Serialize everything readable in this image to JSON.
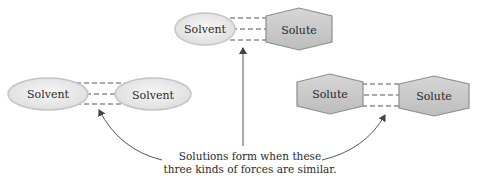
{
  "diagram": {
    "colors": {
      "solvent_fill": "#ececec",
      "solvent_stroke": "#c4c4c4",
      "solute_fill": "#c9c9c9",
      "solute_stroke": "#8e8e8e",
      "dash": "#555555",
      "arrow": "#555555",
      "text": "#2a2a2a"
    },
    "pairs": [
      {
        "id": "solvent-solute",
        "left": {
          "shape": "ellipse",
          "label": "Solvent"
        },
        "right": {
          "shape": "hexagon",
          "label": "Solute"
        }
      },
      {
        "id": "solvent-solvent",
        "left": {
          "shape": "ellipse",
          "label": "Solvent"
        },
        "right": {
          "shape": "ellipse",
          "label": "Solvent"
        }
      },
      {
        "id": "solute-solute",
        "left": {
          "shape": "hexagon",
          "label": "Solute"
        },
        "right": {
          "shape": "hexagon",
          "label": "Solute"
        }
      }
    ],
    "caption": {
      "line1": "Solutions form when these",
      "line2": "three kinds of forces are similar."
    }
  }
}
